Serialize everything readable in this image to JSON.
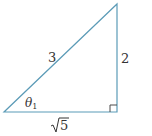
{
  "diagram": {
    "type": "right-triangle",
    "line_color": "#5b9bb7",
    "text_color": "#333333",
    "vertices": {
      "bottom_left": [
        4,
        112
      ],
      "bottom_right": [
        117,
        112
      ],
      "top": [
        117,
        4
      ]
    },
    "labels": {
      "hypotenuse": "3",
      "opposite": "2",
      "adjacent": "√5",
      "angle_symbol": "θ",
      "angle_subscript": "1"
    },
    "right_angle_marker": true
  }
}
